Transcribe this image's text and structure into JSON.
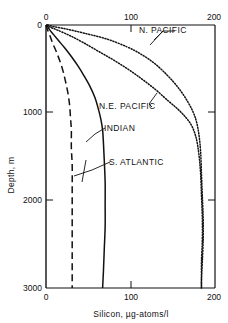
{
  "chart_data": {
    "type": "line",
    "title": "",
    "xlabel": "Silicon, µg-atoms/l",
    "ylabel": "Depth, m",
    "xlim": [
      0,
      200
    ],
    "ylim": [
      0,
      3000
    ],
    "y_inverted": true,
    "grid": false,
    "legend": "inline-annotations",
    "x_ticks_top": [
      "0",
      "100",
      "200"
    ],
    "x_ticks_bottom": [
      "0",
      "100",
      "200"
    ],
    "x_tick_values": [
      0,
      100,
      200
    ],
    "y_ticks": [
      "0",
      "1000",
      "2000",
      "3000"
    ],
    "y_tick_values": [
      0,
      1000,
      2000,
      3000
    ],
    "series": [
      {
        "name": "N. PACIFIC",
        "style": "dotted",
        "label": "N. PACIFIC",
        "x": [
          2,
          10,
          26,
          48,
          72,
          96,
          112,
          126,
          138,
          150,
          160,
          168,
          174,
          178,
          181,
          183,
          184,
          185,
          186,
          186,
          185,
          184,
          184
        ],
        "y": [
          0,
          20,
          50,
          100,
          160,
          250,
          330,
          420,
          520,
          640,
          760,
          880,
          990,
          1100,
          1250,
          1450,
          1700,
          1950,
          2200,
          2450,
          2700,
          2900,
          3000
        ]
      },
      {
        "name": "N.E. PACIFIC",
        "style": "dotted",
        "label": "N.E. PACIFIC",
        "x": [
          1,
          5,
          14,
          28,
          44,
          62,
          80,
          98,
          114,
          130,
          144,
          156,
          166,
          173,
          178,
          181,
          183,
          184,
          185,
          185,
          184,
          184,
          184
        ],
        "y": [
          0,
          25,
          60,
          120,
          200,
          300,
          400,
          510,
          620,
          740,
          860,
          960,
          1060,
          1160,
          1300,
          1480,
          1700,
          1950,
          2200,
          2450,
          2700,
          2900,
          3000
        ]
      },
      {
        "name": "INDIAN",
        "style": "solid",
        "label": "INDIAN",
        "x": [
          1,
          4,
          9,
          15,
          22,
          30,
          38,
          45,
          52,
          58,
          62,
          65,
          67,
          68,
          69,
          70,
          70,
          70,
          69,
          68,
          67
        ],
        "y": [
          0,
          50,
          110,
          180,
          260,
          360,
          470,
          580,
          700,
          830,
          960,
          1080,
          1200,
          1350,
          1550,
          1800,
          2050,
          2300,
          2550,
          2800,
          3000
        ]
      },
      {
        "name": "S. ATLANTIC",
        "style": "dashed",
        "label": "S. ATLANTIC",
        "x": [
          0,
          2,
          5,
          8,
          12,
          16,
          20,
          23,
          26,
          28,
          29,
          30,
          30,
          31,
          31,
          31,
          31,
          31,
          31,
          31
        ],
        "y": [
          0,
          60,
          130,
          210,
          300,
          400,
          520,
          640,
          780,
          920,
          1060,
          1200,
          1400,
          1600,
          1850,
          2100,
          2350,
          2600,
          2850,
          3000
        ]
      }
    ]
  },
  "annotations": {
    "n_pacific": {
      "text": "N. PACIFIC"
    },
    "ne_pacific": {
      "text": "N.E. PACIFIC"
    },
    "indian": {
      "text": "INDIAN"
    },
    "s_atlantic": {
      "text": "S. ATLANTIC"
    }
  },
  "colors": {
    "ink": "#111111",
    "background": "#ffffff"
  }
}
